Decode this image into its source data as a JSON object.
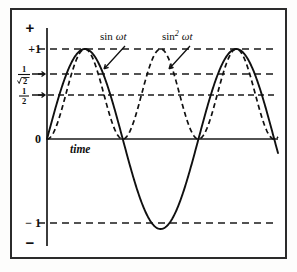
{
  "figure": {
    "background_color": "#ffffff",
    "frame_color": "#2b2b2b",
    "ink_color": "#101010"
  },
  "axes": {
    "x_axis_name": "time",
    "positive_sign": "+",
    "negative_sign": "−",
    "origin_label": "0",
    "y_tick_labels": {
      "plus_one": "+1",
      "one_over_root_two_numerator": "1",
      "one_over_root_two_denominator": "2",
      "one_half_numerator": "1",
      "one_half_denominator": "2",
      "minus_one": "− 1"
    }
  },
  "annotations": [
    {
      "name": "sin-wt-label",
      "function_text": "sin",
      "argument_text": "ωt",
      "exponent": "",
      "x": 100,
      "y": 30
    },
    {
      "name": "sin-squared-wt-label",
      "function_text": "sin",
      "argument_text": "ωt",
      "exponent": "2",
      "x": 163,
      "y": 30
    }
  ],
  "chart_data": {
    "type": "line",
    "title": "",
    "subtitle": "",
    "xlabel": "time",
    "ylabel": "",
    "grid": true,
    "legend_position": "inline-annotation",
    "xlim": [
      0,
      3.05
    ],
    "ylim": [
      -1.25,
      1.25
    ],
    "x_unit": "half periods of sin ωt (π radians each)",
    "gridlines_y": [
      {
        "value": 1,
        "label": "+1",
        "style": "dashed"
      },
      {
        "value": 0.7071,
        "label": "1/√2",
        "style": "dashed"
      },
      {
        "value": 0.5,
        "label": "1/2",
        "style": "dashed"
      },
      {
        "value": 0,
        "label": "0",
        "style": "solid"
      },
      {
        "value": -1,
        "label": "− 1",
        "style": "dashed"
      }
    ],
    "series": [
      {
        "name": "sin ωt",
        "style": "solid",
        "formula": "y = sin(πx)",
        "period_in_x": 2,
        "amplitude": 1,
        "minimum": -1,
        "maximum": 1,
        "zero_crossings_x": [
          0,
          1,
          2,
          3
        ],
        "peaks_x": [
          0.5,
          2.5
        ],
        "troughs_x": [
          1.5
        ],
        "x": [
          0,
          0.125,
          0.25,
          0.375,
          0.5,
          0.625,
          0.75,
          0.875,
          1,
          1.125,
          1.25,
          1.375,
          1.5,
          1.625,
          1.75,
          1.875,
          2,
          2.125,
          2.25,
          2.375,
          2.5,
          2.625,
          2.75,
          2.875,
          3
        ],
        "values": [
          0,
          0.383,
          0.707,
          0.924,
          1,
          0.924,
          0.707,
          0.383,
          0,
          -0.383,
          -0.707,
          -0.924,
          -1,
          -0.924,
          -0.707,
          -0.383,
          0,
          0.383,
          0.707,
          0.924,
          1,
          0.924,
          0.707,
          0.383,
          0
        ]
      },
      {
        "name": "sin² ωt",
        "style": "dashed",
        "formula": "y = sin²(πx)",
        "period_in_x": 1,
        "amplitude": 1,
        "minimum": 0,
        "maximum": 1,
        "zero_crossings_x": [
          0,
          1,
          2,
          3
        ],
        "peaks_x": [
          0.5,
          1.5,
          2.5
        ],
        "troughs_x": [],
        "mean_value": 0.5,
        "x": [
          0,
          0.125,
          0.25,
          0.375,
          0.5,
          0.625,
          0.75,
          0.875,
          1,
          1.125,
          1.25,
          1.375,
          1.5,
          1.625,
          1.75,
          1.875,
          2,
          2.125,
          2.25,
          2.375,
          2.5,
          2.625,
          2.75,
          2.875,
          3
        ],
        "values": [
          0,
          0.146,
          0.5,
          0.854,
          1,
          0.854,
          0.5,
          0.146,
          0,
          0.146,
          0.5,
          0.854,
          1,
          0.854,
          0.5,
          0.146,
          0,
          0.146,
          0.5,
          0.854,
          1,
          0.854,
          0.5,
          0.146,
          0
        ]
      }
    ]
  }
}
